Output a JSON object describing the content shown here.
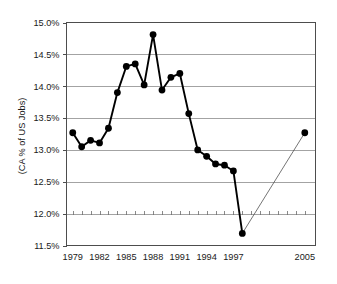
{
  "chart_data": {
    "type": "line",
    "title": "",
    "xlabel": "",
    "ylabel": "(CA % of US Jobs)",
    "ylim": [
      11.5,
      15.0
    ],
    "xlim": [
      1978.3,
      2006.2
    ],
    "ytick_labels": [
      "11.5%",
      "12.0%",
      "12.5%",
      "13.0%",
      "13.5%",
      "14.0%",
      "14.5%",
      "15.0%"
    ],
    "ytick_values": [
      11.5,
      12.0,
      12.5,
      13.0,
      13.5,
      14.0,
      14.5,
      15.0
    ],
    "xtick_labels": [
      "1979",
      "1982",
      "1985",
      "1988",
      "1991",
      "1994",
      "1997",
      "2005"
    ],
    "xtick_values": [
      1979,
      1982,
      1985,
      1988,
      1991,
      1994,
      1997,
      2005
    ],
    "grid": "horizontal",
    "legend": "none",
    "x": [
      1979,
      1980,
      1981,
      1982,
      1983,
      1984,
      1985,
      1986,
      1987,
      1988,
      1989,
      1990,
      1991,
      1992,
      1993,
      1994,
      1995,
      1996,
      1997,
      1998,
      2005
    ],
    "values": [
      13.27,
      13.05,
      13.15,
      13.11,
      13.34,
      13.9,
      14.31,
      14.35,
      14.02,
      14.81,
      13.94,
      14.14,
      14.2,
      13.57,
      13.0,
      12.9,
      12.78,
      12.76,
      12.67,
      11.69,
      13.27
    ],
    "series": [
      {
        "name": "CA % of US Jobs (historical)",
        "style": "solid-thick-with-markers",
        "x": [
          1979,
          1980,
          1981,
          1982,
          1983,
          1984,
          1985,
          1986,
          1987,
          1988,
          1989,
          1990,
          1991,
          1992,
          1993,
          1994,
          1995,
          1996,
          1997,
          1998
        ],
        "values": [
          13.27,
          13.05,
          13.15,
          13.11,
          13.34,
          13.9,
          14.31,
          14.35,
          14.02,
          14.81,
          13.94,
          14.14,
          14.2,
          13.57,
          13.0,
          12.9,
          12.78,
          12.76,
          12.67,
          11.69
        ]
      },
      {
        "name": "Projection to 2005",
        "style": "thin-line",
        "x": [
          1998,
          2005
        ],
        "values": [
          11.69,
          13.27
        ]
      }
    ],
    "minor_x_ticks_on_gridline": 12.0,
    "marker_shape": "circle",
    "colors": {
      "line": "#000000",
      "marker": "#000000",
      "grid": "#8c8c8c",
      "frame": "#4d4d4d",
      "text": "#1a1a1a",
      "background": "#ffffff",
      "projection": "#3a3a3a"
    }
  }
}
